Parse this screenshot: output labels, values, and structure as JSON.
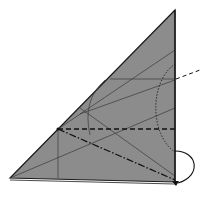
{
  "diagram": {
    "title": "",
    "type": "origami-fold-diagram",
    "colors": {
      "paper_fill": "#8c8c8c",
      "outline": "#1a1a1a",
      "crease": "#3c3c3c",
      "background": "#ffffff"
    },
    "shape": {
      "name": "right-triangle",
      "points": [
        [
          175,
          10
        ],
        [
          10,
          178
        ],
        [
          175,
          182
        ]
      ]
    },
    "lines": {
      "valley_fold_horizontal": {
        "style": "dashed",
        "from": [
          58,
          129
        ],
        "to": [
          175,
          129
        ]
      },
      "mountain_fold_diagonal": {
        "style": "dash-dot",
        "from": [
          58,
          129
        ],
        "to": [
          175,
          180
        ]
      },
      "extension_dashed": {
        "style": "dashed",
        "from": [
          175,
          79
        ],
        "to": [
          200,
          70
        ]
      },
      "vertical_crease": {
        "style": "solid-thin",
        "from": [
          58,
          129
        ],
        "to": [
          58,
          178
        ]
      },
      "crease_1": {
        "style": "solid-thin",
        "from": [
          58,
          129
        ],
        "to": [
          175,
          50
        ]
      },
      "crease_2": {
        "style": "solid-thin",
        "from": [
          10,
          178
        ],
        "to": [
          175,
          108
        ]
      },
      "crease_3": {
        "style": "solid-thin",
        "from": [
          80,
          115
        ],
        "to": [
          175,
          80
        ]
      },
      "crease_4": {
        "style": "solid-thin",
        "from": [
          110,
          79
        ],
        "to": [
          175,
          79
        ]
      },
      "crease_5": {
        "style": "solid-thin",
        "from": [
          82,
          110
        ],
        "to": [
          175,
          176
        ]
      }
    },
    "arrows": {
      "dotted_arc": {
        "style": "dotted",
        "description": "fold arc from right edge"
      },
      "loop_arc": {
        "style": "solid",
        "description": "turn-over loop at bottom-right corner"
      }
    },
    "labels": []
  }
}
